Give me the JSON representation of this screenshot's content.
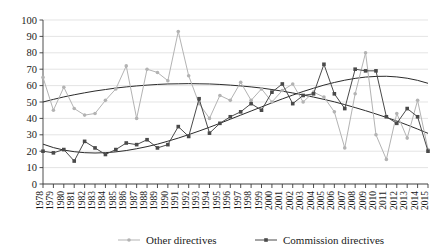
{
  "chart_data": {
    "type": "line",
    "title": "",
    "xlabel": "",
    "ylabel": "",
    "ylim": [
      0,
      100
    ],
    "ytick_step": 10,
    "grid": true,
    "legend_position": "bottom",
    "categories": [
      "1978",
      "1979",
      "1980",
      "1981",
      "1982",
      "1983",
      "1984",
      "1985",
      "1986",
      "1987",
      "1988",
      "1989",
      "1990",
      "1991",
      "1992",
      "1993",
      "1994",
      "1995",
      "1996",
      "1997",
      "1998",
      "1999",
      "2000",
      "2001",
      "2002",
      "2003",
      "2004",
      "2005",
      "2006",
      "2007",
      "2008",
      "2009",
      "2010",
      "2011",
      "2012",
      "2013",
      "2014",
      "2015"
    ],
    "yticks": [
      0,
      10,
      20,
      30,
      40,
      50,
      60,
      70,
      80,
      90,
      100
    ],
    "series": [
      {
        "name": "Other directives",
        "color": "#b3b3b3",
        "marker": "circle",
        "values": [
          65,
          45,
          59,
          46,
          42,
          43,
          51,
          58,
          72,
          40,
          70,
          68,
          63,
          93,
          66,
          49,
          40,
          54,
          51,
          62,
          51,
          58,
          50,
          57,
          61,
          50,
          56,
          53,
          44,
          22,
          55,
          80,
          30,
          15,
          43,
          28,
          51,
          21
        ]
      },
      {
        "name": "Commission directives",
        "color": "#4a4a4a",
        "marker": "square",
        "values": [
          20,
          19,
          21,
          14,
          26,
          22,
          18,
          21,
          25,
          24,
          27,
          22,
          24,
          35,
          29,
          52,
          31,
          37,
          41,
          44,
          49,
          45,
          56,
          61,
          49,
          54,
          55,
          73,
          55,
          46,
          70,
          69,
          69,
          41,
          37,
          46,
          41,
          20
        ]
      }
    ],
    "trendlines": [
      {
        "name": "Other directives trend",
        "for_series": "Other directives",
        "color": "#2b2b2b",
        "type": "polynomial",
        "values": [
          50.0,
          51.6,
          53.1,
          54.4,
          55.6,
          56.7,
          57.6,
          58.5,
          59.2,
          59.8,
          60.3,
          60.7,
          61.0,
          61.1,
          61.2,
          61.1,
          61.0,
          60.7,
          60.3,
          59.8,
          59.2,
          58.5,
          57.6,
          56.6,
          55.5,
          54.3,
          53.0,
          51.6,
          50.1,
          48.4,
          46.6,
          44.7,
          42.7,
          40.6,
          38.4,
          36.0,
          33.5,
          30.9
        ]
      },
      {
        "name": "Commission directives trend",
        "for_series": "Commission directives",
        "color": "#2b2b2b",
        "type": "polynomial",
        "values": [
          24.3,
          22.2,
          20.7,
          19.7,
          19.1,
          18.9,
          19.1,
          19.6,
          20.4,
          21.5,
          22.8,
          24.3,
          26.1,
          28.0,
          30.1,
          32.3,
          34.6,
          37.0,
          39.5,
          42.0,
          44.5,
          47.0,
          49.5,
          51.9,
          54.2,
          56.4,
          58.4,
          60.3,
          61.9,
          63.3,
          64.4,
          65.2,
          65.6,
          65.7,
          65.3,
          64.5,
          63.2,
          61.4
        ]
      }
    ]
  },
  "legend": {
    "items": [
      {
        "label": "Other directives",
        "color": "#b3b3b3",
        "marker": "circle"
      },
      {
        "label": "Commission directives",
        "color": "#4a4a4a",
        "marker": "square"
      }
    ]
  }
}
